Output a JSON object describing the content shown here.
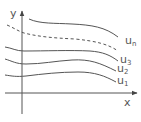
{
  "diagram": {
    "axes": {
      "x_label": "x",
      "y_label": "y",
      "color": "#555555"
    },
    "curves": [
      {
        "name": "u_n",
        "label_main": "u",
        "label_sub": "n",
        "style": "solid"
      },
      {
        "name": "dashed",
        "label_main": "",
        "label_sub": "",
        "style": "dashed"
      },
      {
        "name": "u_3",
        "label_main": "u",
        "label_sub": "3",
        "style": "solid"
      },
      {
        "name": "u_2",
        "label_main": "u",
        "label_sub": "2",
        "style": "solid"
      },
      {
        "name": "u_1",
        "label_main": "u",
        "label_sub": "1",
        "style": "solid"
      }
    ],
    "line_color": "#555555"
  }
}
